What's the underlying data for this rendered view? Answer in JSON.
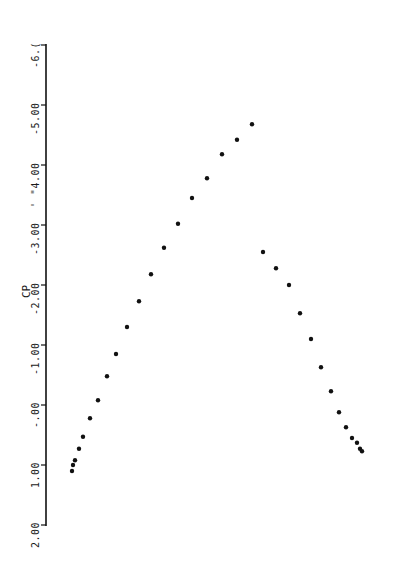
{
  "chart_data": {
    "type": "scatter",
    "title": "",
    "xlabel": "",
    "ylabel": "CP",
    "orientation": "rotated 90deg (Cp axis drawn vertically on left, increasing downward)",
    "ylim": [
      -6.0,
      2.0
    ],
    "y_ticks": [
      -6.0,
      -5.0,
      -4.0,
      -3.0,
      -2.0,
      -1.0,
      0.0,
      1.0,
      2.0
    ],
    "y_tick_labels": [
      "-6.(",
      "-5.00",
      "' \"4.00",
      "-3.00",
      "-2.00",
      "-1.00",
      "-.00",
      "1.00",
      "2.00"
    ],
    "grid": false,
    "legend": null,
    "series": [
      {
        "name": "left branch",
        "x": [
          72,
          73,
          75,
          79,
          83,
          90,
          98,
          107,
          116,
          127,
          139,
          151,
          164,
          178,
          192,
          207,
          222,
          237,
          252
        ],
        "values": [
          1.1,
          1.0,
          0.92,
          0.73,
          0.53,
          0.22,
          -0.08,
          -0.48,
          -0.85,
          -1.3,
          -1.73,
          -2.18,
          -2.62,
          -3.02,
          -3.45,
          -3.78,
          -4.18,
          -4.42,
          -4.68
        ]
      },
      {
        "name": "right branch",
        "x": [
          263,
          276,
          289,
          300,
          311,
          321,
          331,
          339,
          346,
          352,
          357,
          360,
          362
        ],
        "values": [
          -2.55,
          -2.28,
          -2.0,
          -1.53,
          -1.1,
          -0.63,
          -0.23,
          0.12,
          0.37,
          0.55,
          0.63,
          0.73,
          0.77
        ]
      }
    ]
  },
  "axis": {
    "title": "CP",
    "ticks": [
      {
        "label": "-6.(",
        "value": -6.0
      },
      {
        "label": "-5.00",
        "value": -5.0
      },
      {
        "label": "' \"4.00",
        "value": -4.0
      },
      {
        "label": "-3.00",
        "value": -3.0
      },
      {
        "label": "-2.00",
        "value": -2.0
      },
      {
        "label": "-1.00",
        "value": -1.0
      },
      {
        "label": "-.00",
        "value": 0.0
      },
      {
        "label": "1.00",
        "value": 1.0
      },
      {
        "label": "2.00",
        "value": 2.0
      }
    ]
  },
  "colors": {
    "ink": "#111111",
    "background": "#ffffff"
  }
}
